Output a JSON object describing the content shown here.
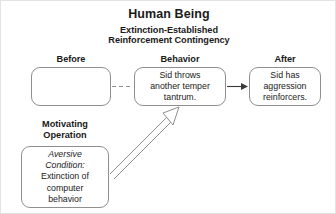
{
  "diagram": {
    "title": "Human Being",
    "subtitle_line1": "Extinction-Established",
    "subtitle_line2": "Reinforcement Contingency",
    "columns": {
      "before_label": "Before",
      "behavior_label": "Behavior",
      "after_label": "After"
    },
    "boxes": {
      "before": {
        "text": ""
      },
      "behavior": {
        "line1": "Sid throws",
        "line2": "another temper",
        "line3": "tantrum."
      },
      "after": {
        "line1": "Sid has",
        "line2": "aggression",
        "line3": "reinforcers."
      },
      "motivating_operation": {
        "label_line1": "Motivating",
        "label_line2": "Operation",
        "italic_line1": "Aversive",
        "italic_line2": "Condition:",
        "line3": "Extinction of",
        "line4": "computer",
        "line5": "behavior"
      }
    },
    "connectors": {
      "before_to_behavior": "dashed-line",
      "behavior_to_after": "solid-arrow",
      "mo_to_behavior": "hollow-block-arrow"
    },
    "colors": {
      "stroke": "#8f8f8f",
      "text": "#1a1a1a",
      "background": "#ffffff",
      "frame": "#e3e3e3"
    }
  }
}
